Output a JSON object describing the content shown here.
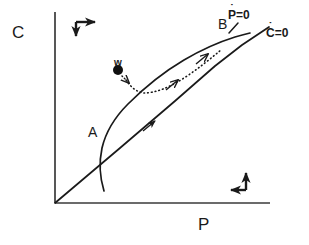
{
  "figure": {
    "kind": "phase-plane-nullcline-diagram",
    "background_color": "#ffffff",
    "ink_color": "#1a1a1a",
    "axes": {
      "y_label": "C",
      "x_label": "P",
      "origin_px": [
        55,
        203
      ],
      "y_top_px": [
        55,
        12
      ],
      "x_right_px": [
        270,
        203
      ]
    },
    "labels": {
      "point_a": "A",
      "point_b": "B",
      "point_w": "w",
      "nullcline_p_base": "P",
      "nullcline_p_dot": "˙",
      "nullcline_p_rest": "=0",
      "nullcline_p_full": "Ṗ=0",
      "nullcline_c_base": "C",
      "nullcline_c_dot": "˙",
      "nullcline_c_rest": "=0",
      "nullcline_c_full": "Ċ=0"
    },
    "direction_indicators": [
      {
        "name": "top-left-direction-marker",
        "horizontal_arrow": "right",
        "vertical_arrow": "down",
        "corner_px": [
          76,
          22
        ]
      },
      {
        "name": "bottom-right-direction-marker",
        "horizontal_arrow": "left",
        "vertical_arrow": "up",
        "corner_px": [
          246,
          190
        ]
      }
    ],
    "curves": {
      "c_nullcline_straight": {
        "name": "C-dot-equals-zero",
        "style": "solid",
        "description": "straight line through origin rising to upper right past B",
        "points_px": [
          [
            55,
            203
          ],
          [
            120,
            148
          ],
          [
            175,
            101
          ],
          [
            215,
            66
          ],
          [
            240,
            46
          ],
          [
            268,
            28
          ]
        ]
      },
      "p_nullcline_sigmoid": {
        "name": "P-dot-equals-zero",
        "style": "solid",
        "description": "S-shaped sigmoid curve crossing the straight line at A and B",
        "points_px": [
          [
            104,
            191
          ],
          [
            100,
            170
          ],
          [
            101,
            150
          ],
          [
            109,
            128
          ],
          [
            124,
            106
          ],
          [
            143,
            86
          ],
          [
            165,
            66
          ],
          [
            190,
            51
          ],
          [
            212,
            42
          ],
          [
            232,
            36
          ],
          [
            248,
            33
          ]
        ]
      },
      "trajectory_dotted": {
        "name": "trajectory-from-w",
        "style": "dotted",
        "description": "dotted trajectory leaving w, dropping to the sigmoid then sweeping right up to B",
        "points_px": [
          [
            122,
            75
          ],
          [
            132,
            86
          ],
          [
            141,
            93
          ],
          [
            152,
            92
          ],
          [
            168,
            86
          ],
          [
            185,
            77
          ],
          [
            200,
            67
          ],
          [
            213,
            57
          ],
          [
            222,
            49
          ]
        ]
      }
    },
    "markers": {
      "w_dot_px": [
        118,
        70
      ],
      "w_dot_radius_px": 5
    },
    "flow_arrows": [
      {
        "name": "arrow-on-dotted-lower",
        "at_px": [
          178,
          77
        ],
        "angle_deg": -38
      },
      {
        "name": "arrow-on-dotted-upper",
        "at_px": [
          206,
          55
        ],
        "angle_deg": -40
      },
      {
        "name": "arrow-on-straight-line",
        "at_px": [
          152,
          123
        ],
        "angle_deg": -40
      },
      {
        "name": "arrow-into-sigmoid",
        "at_px": [
          136,
          90
        ],
        "angle_deg": 42
      }
    ]
  }
}
